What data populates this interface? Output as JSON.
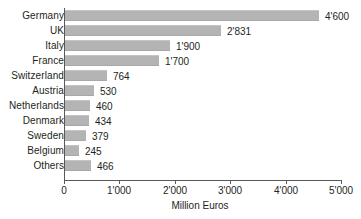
{
  "chart_data": {
    "type": "bar",
    "orientation": "horizontal",
    "title": "",
    "xlabel": "Million Euros",
    "ylabel": "",
    "categories": [
      "Germany",
      "UK",
      "Italy",
      "France",
      "Switzerland",
      "Austria",
      "Netherlands",
      "Denmark",
      "Sweden",
      "Belgium",
      "Others"
    ],
    "values": [
      4600,
      2831,
      1900,
      1700,
      764,
      530,
      460,
      434,
      379,
      245,
      466
    ],
    "value_labels": [
      "4'600",
      "2'831",
      "1'900",
      "1'700",
      "764",
      "530",
      "460",
      "434",
      "379",
      "245",
      "466"
    ],
    "xlim": [
      0,
      5000
    ],
    "xticks": [
      0,
      1000,
      2000,
      3000,
      4000,
      5000
    ],
    "xtick_labels": [
      "0",
      "1'000",
      "2'000",
      "3'000",
      "4'000",
      "5'000"
    ],
    "grid": false,
    "legend": null,
    "bar_color": "#b4b4b4",
    "axis_color": "#58585a",
    "text_color": "#231f20",
    "background": "#ffffff"
  }
}
